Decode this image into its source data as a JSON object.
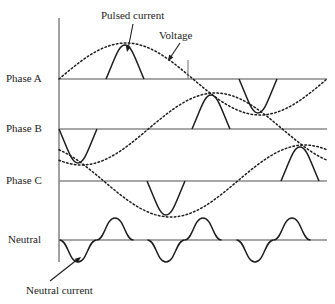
{
  "figure": {
    "background": "#ffffff",
    "line_color": "#1d1d1d",
    "axis_color": "#8a8a8a",
    "baseline_color": "#8a8a8a"
  },
  "axis": {
    "x": 59,
    "y_top": 18,
    "y_bottom": 262,
    "baseline_x_start": 59,
    "baseline_x_end": 327
  },
  "row_labels": [
    {
      "name": "phase-a",
      "text": "Phase A",
      "x": 6,
      "y": 73,
      "baseline_y": 79
    },
    {
      "name": "phase-b",
      "text": "Phase B",
      "x": 6,
      "y": 123,
      "baseline_y": 129
    },
    {
      "name": "phase-c",
      "text": "Phase C",
      "x": 6,
      "y": 175,
      "baseline_y": 181
    },
    {
      "name": "neutral",
      "text": "Neutral",
      "x": 8,
      "y": 234,
      "baseline_y": 240
    }
  ],
  "annotations": [
    {
      "name": "pulsed-current",
      "text": "Pulsed current",
      "x": 101,
      "y": 10,
      "leader": "M133,24 L128,49",
      "arrow_at": [
        127,
        52
      ]
    },
    {
      "name": "voltage",
      "text": "Voltage",
      "x": 159,
      "y": 30,
      "leader": "M180,43 L170,58",
      "arrow_at": [
        168,
        61
      ]
    },
    {
      "name": "neutral-current",
      "text": "Neutral current",
      "x": 26,
      "y": 285,
      "leader": "M50,281 L78,259",
      "arrow_at": [
        81,
        257
      ]
    }
  ],
  "chart_data": {
    "type": "line",
    "xlabel": "",
    "ylabel": "",
    "grid": false,
    "legend": [
      "Voltage (dotted sine)",
      "Pulsed current (solid)",
      "Neutral current (solid)"
    ],
    "voltage_amplitude": 36,
    "neutral_amplitude": 22,
    "pulse_half_width": 19,
    "cycle_length": 268,
    "series": [
      {
        "name": "Phase A voltage",
        "style": "dotted",
        "baseline_y": 79,
        "amplitude": 36,
        "phase_deg": 0,
        "description": "Positive peak near x=125, zero crossing x=190, negative peak near x=258"
      },
      {
        "name": "Phase A pulsed current",
        "style": "solid",
        "baseline_y": 79,
        "pulses": [
          {
            "center_x": 125,
            "peak_y": 45,
            "polarity": "positive"
          },
          {
            "center_x": 258,
            "peak_y": 113,
            "polarity": "negative"
          }
        ]
      },
      {
        "name": "Phase B voltage",
        "style": "dotted",
        "baseline_y": 129,
        "amplitude": 36,
        "phase_deg": -120,
        "description": "Negative peak near x=78, zero crossing x=145, positive peak near x=211"
      },
      {
        "name": "Phase B pulsed current",
        "style": "solid",
        "baseline_y": 129,
        "pulses": [
          {
            "center_x": 78,
            "peak_y": 163,
            "polarity": "negative"
          },
          {
            "center_x": 211,
            "peak_y": 95,
            "polarity": "positive"
          }
        ]
      },
      {
        "name": "Phase C voltage",
        "style": "dotted",
        "baseline_y": 181,
        "amplitude": 36,
        "phase_deg": 120,
        "description": "Starts high at axis, negative peak near x=166, positive peak near x=300"
      },
      {
        "name": "Phase C pulsed current",
        "style": "solid",
        "baseline_y": 181,
        "pulses": [
          {
            "center_x": 166,
            "peak_y": 215,
            "polarity": "negative"
          },
          {
            "center_x": 300,
            "peak_y": 147,
            "polarity": "positive"
          }
        ]
      },
      {
        "name": "Neutral current",
        "style": "solid",
        "baseline_y": 240,
        "amplitude": 22,
        "humps": [
          {
            "center_x": 78,
            "polarity": "negative"
          },
          {
            "center_x": 115,
            "polarity": "positive"
          },
          {
            "center_x": 166,
            "polarity": "negative"
          },
          {
            "center_x": 203,
            "polarity": "positive"
          },
          {
            "center_x": 255,
            "polarity": "negative"
          },
          {
            "center_x": 292,
            "polarity": "positive"
          }
        ]
      }
    ]
  }
}
